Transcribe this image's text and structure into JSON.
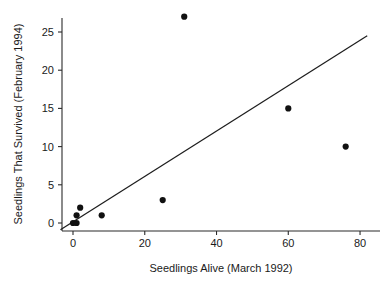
{
  "chart_data": {
    "type": "scatter",
    "title": "",
    "xlabel": "Seedlings Alive (March 1992)",
    "ylabel": "Seedlings That Survived (February 1994)",
    "xlim": [
      -4,
      84
    ],
    "ylim": [
      -1.5,
      28
    ],
    "xticks": [
      0,
      20,
      40,
      60,
      80
    ],
    "yticks": [
      0,
      5,
      10,
      15,
      20,
      25
    ],
    "xtick_labels": [
      "0",
      "20",
      "40",
      "60",
      "80"
    ],
    "ytick_labels": [
      "0",
      "5",
      "10",
      "15",
      "20",
      "25"
    ],
    "grid": false,
    "legend": "none",
    "marker": "filled-circle",
    "marker_color": "#111111",
    "points": [
      {
        "x": 0,
        "y": 0
      },
      {
        "x": 1,
        "y": 0
      },
      {
        "x": 1,
        "y": 1
      },
      {
        "x": 2,
        "y": 2
      },
      {
        "x": 8,
        "y": 1
      },
      {
        "x": 25,
        "y": 3
      },
      {
        "x": 31,
        "y": 27
      },
      {
        "x": 60,
        "y": 15
      },
      {
        "x": 76,
        "y": 10
      }
    ],
    "fit_line": {
      "type": "linear",
      "slope": 0.297,
      "intercept": 0.15,
      "x_start": -3.5,
      "x_end": 82,
      "color": "#1d1d1d"
    }
  },
  "axis": {
    "x_title": "Seedlings Alive (March 1992)",
    "y_title": "Seedlings That Survived (February 1994)"
  }
}
